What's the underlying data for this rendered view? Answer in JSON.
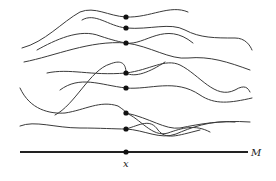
{
  "diagram": {
    "base_line": {
      "label": "M",
      "x1": 20,
      "x2": 248,
      "y": 152
    },
    "base_point": {
      "label": "x",
      "cx": 126,
      "cy": 152
    },
    "stalk_points": [
      {
        "cx": 126,
        "cy": 17
      },
      {
        "cx": 126,
        "cy": 28
      },
      {
        "cx": 126,
        "cy": 43
      },
      {
        "cx": 126,
        "cy": 73
      },
      {
        "cx": 126,
        "cy": 88
      },
      {
        "cx": 126,
        "cy": 113
      },
      {
        "cx": 126,
        "cy": 129
      }
    ],
    "colors": {
      "ink": "#3a3a3a",
      "axis": "#222222",
      "background": "#ffffff"
    }
  }
}
